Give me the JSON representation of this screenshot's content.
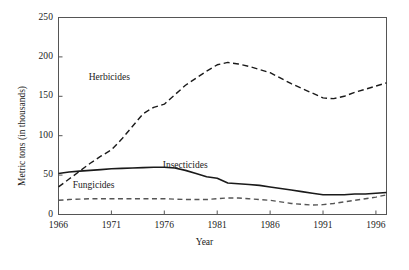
{
  "chart_data": {
    "type": "line",
    "title": "",
    "xlabel": "Year",
    "ylabel": "Metric tons (in thousands)",
    "xlim": [
      1966,
      1997
    ],
    "ylim": [
      0,
      250
    ],
    "xticks": [
      1966,
      1971,
      1976,
      1981,
      1986,
      1991,
      1996
    ],
    "xtick_labels": [
      "1966",
      "1971",
      "1976",
      "1981",
      "1986",
      "1991",
      "1996"
    ],
    "yticks": [
      0,
      50,
      100,
      150,
      200,
      250
    ],
    "ytick_labels": [
      "0",
      "50",
      "100",
      "150",
      "200",
      "250"
    ],
    "grid": false,
    "legend_position": "inline-annotations",
    "series": [
      {
        "name": "Herbicides",
        "style": "dashed",
        "color": "#1a1a1a",
        "label_x": 1971.5,
        "label_y": 173,
        "x": [
          1966,
          1967,
          1968,
          1969,
          1970,
          1971,
          1972,
          1973,
          1974,
          1975,
          1976,
          1977,
          1978,
          1979,
          1980,
          1981,
          1982,
          1983,
          1984,
          1985,
          1986,
          1987,
          1988,
          1989,
          1990,
          1991,
          1992,
          1993,
          1994,
          1995,
          1996,
          1997
        ],
        "values": [
          35,
          45,
          55,
          65,
          74,
          82,
          96,
          112,
          128,
          136,
          140,
          152,
          164,
          173,
          182,
          190,
          193,
          191,
          188,
          184,
          180,
          173,
          166,
          160,
          154,
          148,
          147,
          150,
          155,
          159,
          163,
          167
        ]
      },
      {
        "name": "Insecticides",
        "style": "solid",
        "color": "#1a1a1a",
        "label_x": 1978.5,
        "label_y": 62,
        "x": [
          1966,
          1967,
          1968,
          1969,
          1970,
          1971,
          1972,
          1973,
          1974,
          1975,
          1976,
          1977,
          1978,
          1979,
          1980,
          1981,
          1982,
          1983,
          1984,
          1985,
          1986,
          1987,
          1988,
          1989,
          1990,
          1991,
          1992,
          1993,
          1994,
          1995,
          1996,
          1997
        ],
        "values": [
          52,
          54,
          55,
          56,
          57,
          58,
          58.5,
          59,
          59.5,
          60,
          60,
          59,
          56,
          52,
          48,
          46,
          40,
          39,
          38,
          37,
          35,
          33,
          31,
          29,
          27,
          25,
          25,
          25,
          26,
          26,
          27,
          28
        ]
      },
      {
        "name": "Fungicides",
        "style": "dashed",
        "color": "#555555",
        "label_x": 1970,
        "label_y": 36,
        "x": [
          1966,
          1967,
          1968,
          1969,
          1970,
          1971,
          1972,
          1973,
          1974,
          1975,
          1976,
          1977,
          1978,
          1979,
          1980,
          1981,
          1982,
          1983,
          1984,
          1985,
          1986,
          1987,
          1988,
          1989,
          1990,
          1991,
          1992,
          1993,
          1994,
          1995,
          1996,
          1997
        ],
        "values": [
          18,
          19,
          19.5,
          20,
          20,
          20,
          20,
          20,
          20,
          20,
          20,
          19.5,
          19,
          19,
          19,
          20,
          21,
          21,
          20,
          19,
          18,
          16,
          14,
          13,
          12,
          12.5,
          14,
          16,
          18,
          20,
          22,
          25
        ]
      }
    ]
  },
  "axes": {
    "y_title": "Metric tons (in thousands)",
    "x_title": "Year"
  },
  "colors": {
    "axis": "#555555",
    "herbicides": "#1a1a1a",
    "insecticides": "#1a1a1a",
    "fungicides": "#555555",
    "text": "#1a1a1a",
    "background": "#ffffff"
  }
}
